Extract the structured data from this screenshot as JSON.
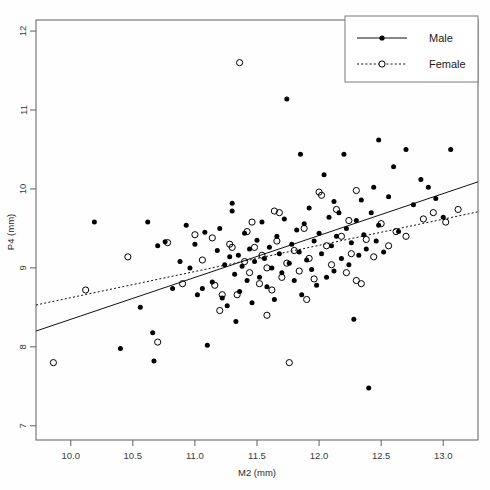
{
  "chart_data": {
    "type": "scatter",
    "title": "",
    "xlabel": "M2 (mm)",
    "ylabel": "P4 (mm)",
    "xlim": [
      9.72,
      13.28
    ],
    "ylim": [
      6.82,
      12.14
    ],
    "xticks": [
      "10.0",
      "10.5",
      "11.0",
      "11.5",
      "12.0",
      "12.5",
      "13.0"
    ],
    "xtick_values": [
      10.0,
      10.5,
      11.0,
      11.5,
      12.0,
      12.5,
      13.0
    ],
    "yticks": [
      "12",
      "11",
      "10",
      "9",
      "8",
      "7"
    ],
    "ytick_values": [
      12,
      11,
      10,
      9,
      8,
      7
    ],
    "grid": false,
    "legend_position": "top-right",
    "series": [
      {
        "name": "Male",
        "marker": "filled-circle",
        "line_style": "solid",
        "color": "#000000",
        "points": [
          [
            10.19,
            9.58
          ],
          [
            10.4,
            7.98
          ],
          [
            10.56,
            8.5
          ],
          [
            10.62,
            9.58
          ],
          [
            10.66,
            8.18
          ],
          [
            10.67,
            7.82
          ],
          [
            10.7,
            9.28
          ],
          [
            10.76,
            9.33
          ],
          [
            10.82,
            8.74
          ],
          [
            10.88,
            9.08
          ],
          [
            10.93,
            9.54
          ],
          [
            10.96,
            9.0
          ],
          [
            11.0,
            9.3
          ],
          [
            11.02,
            8.66
          ],
          [
            11.06,
            8.74
          ],
          [
            11.08,
            9.45
          ],
          [
            11.1,
            8.02
          ],
          [
            11.14,
            8.82
          ],
          [
            11.18,
            9.22
          ],
          [
            11.2,
            9.5
          ],
          [
            11.22,
            8.62
          ],
          [
            11.24,
            9.04
          ],
          [
            11.26,
            8.52
          ],
          [
            11.28,
            9.14
          ],
          [
            11.3,
            9.72
          ],
          [
            11.32,
            8.92
          ],
          [
            11.33,
            8.32
          ],
          [
            11.35,
            9.16
          ],
          [
            11.36,
            8.7
          ],
          [
            11.38,
            9.02
          ],
          [
            11.4,
            9.44
          ],
          [
            11.42,
            8.84
          ],
          [
            11.44,
            9.24
          ],
          [
            11.46,
            8.56
          ],
          [
            11.48,
            9.08
          ],
          [
            11.5,
            9.35
          ],
          [
            11.52,
            8.88
          ],
          [
            11.54,
            9.58
          ],
          [
            11.56,
            9.12
          ],
          [
            11.58,
            8.76
          ],
          [
            11.6,
            9.26
          ],
          [
            11.62,
            9.0
          ],
          [
            11.64,
            8.6
          ],
          [
            11.66,
            9.4
          ],
          [
            11.68,
            9.18
          ],
          [
            11.7,
            8.94
          ],
          [
            11.72,
            9.62
          ],
          [
            11.74,
            11.14
          ],
          [
            11.76,
            9.06
          ],
          [
            11.78,
            9.3
          ],
          [
            11.8,
            8.84
          ],
          [
            11.82,
            9.48
          ],
          [
            11.84,
            9.2
          ],
          [
            11.86,
            8.66
          ],
          [
            11.88,
            9.56
          ],
          [
            11.9,
            9.1
          ],
          [
            11.92,
            9.76
          ],
          [
            11.94,
            8.98
          ],
          [
            11.96,
            9.34
          ],
          [
            11.98,
            8.78
          ],
          [
            12.0,
            9.44
          ],
          [
            12.02,
            9.18
          ],
          [
            12.04,
            10.18
          ],
          [
            12.06,
            8.88
          ],
          [
            12.08,
            9.64
          ],
          [
            12.1,
            9.28
          ],
          [
            12.12,
            8.96
          ],
          [
            12.14,
            9.4
          ],
          [
            12.16,
            9.7
          ],
          [
            12.18,
            9.12
          ],
          [
            12.2,
            10.44
          ],
          [
            12.22,
            9.5
          ],
          [
            12.24,
            9.04
          ],
          [
            12.26,
            9.32
          ],
          [
            12.28,
            8.35
          ],
          [
            12.3,
            9.6
          ],
          [
            12.32,
            9.16
          ],
          [
            12.34,
            9.86
          ],
          [
            12.36,
            9.42
          ],
          [
            12.38,
            9.24
          ],
          [
            12.4,
            7.48
          ],
          [
            12.42,
            9.7
          ],
          [
            12.44,
            10.02
          ],
          [
            12.46,
            9.34
          ],
          [
            12.48,
            9.54
          ],
          [
            12.52,
            9.2
          ],
          [
            12.56,
            9.9
          ],
          [
            12.6,
            10.28
          ],
          [
            12.64,
            9.46
          ],
          [
            12.7,
            10.5
          ],
          [
            12.76,
            9.8
          ],
          [
            12.82,
            10.12
          ],
          [
            12.88,
            10.02
          ],
          [
            12.94,
            9.88
          ],
          [
            13.0,
            9.64
          ],
          [
            13.06,
            10.5
          ],
          [
            11.85,
            10.44
          ],
          [
            12.48,
            10.62
          ],
          [
            11.3,
            9.82
          ],
          [
            12.12,
            9.84
          ]
        ]
      },
      {
        "name": "Female",
        "marker": "open-circle",
        "line_style": "dotted",
        "color": "#000000",
        "points": [
          [
            9.86,
            7.8
          ],
          [
            10.12,
            8.72
          ],
          [
            10.46,
            9.14
          ],
          [
            10.7,
            8.06
          ],
          [
            10.78,
            9.32
          ],
          [
            10.9,
            8.8
          ],
          [
            11.0,
            9.42
          ],
          [
            11.06,
            9.1
          ],
          [
            11.14,
            9.38
          ],
          [
            11.16,
            8.78
          ],
          [
            11.22,
            8.66
          ],
          [
            11.28,
            9.3
          ],
          [
            11.3,
            9.26
          ],
          [
            11.34,
            8.66
          ],
          [
            11.36,
            11.6
          ],
          [
            11.4,
            9.08
          ],
          [
            11.42,
            9.46
          ],
          [
            11.44,
            8.94
          ],
          [
            11.48,
            9.26
          ],
          [
            11.52,
            8.8
          ],
          [
            11.54,
            9.16
          ],
          [
            11.58,
            9.0
          ],
          [
            11.62,
            8.72
          ],
          [
            11.66,
            9.34
          ],
          [
            11.7,
            8.88
          ],
          [
            11.74,
            9.06
          ],
          [
            11.76,
            7.8
          ],
          [
            11.8,
            9.22
          ],
          [
            11.84,
            8.96
          ],
          [
            11.88,
            9.5
          ],
          [
            11.92,
            9.12
          ],
          [
            11.96,
            8.86
          ],
          [
            12.0,
            9.96
          ],
          [
            12.02,
            9.92
          ],
          [
            12.06,
            9.28
          ],
          [
            12.1,
            9.04
          ],
          [
            12.14,
            9.74
          ],
          [
            12.18,
            9.4
          ],
          [
            12.22,
            8.94
          ],
          [
            12.26,
            9.18
          ],
          [
            12.3,
            9.98
          ],
          [
            12.34,
            8.8
          ],
          [
            12.38,
            9.36
          ],
          [
            12.44,
            9.14
          ],
          [
            12.5,
            9.56
          ],
          [
            12.56,
            9.28
          ],
          [
            12.62,
            9.46
          ],
          [
            12.7,
            9.4
          ],
          [
            12.84,
            9.62
          ],
          [
            12.92,
            9.7
          ],
          [
            13.02,
            9.58
          ],
          [
            13.12,
            9.74
          ],
          [
            11.64,
            9.72
          ],
          [
            11.68,
            9.7
          ],
          [
            11.46,
            9.58
          ],
          [
            12.24,
            9.6
          ],
          [
            11.58,
            8.4
          ],
          [
            11.2,
            8.46
          ],
          [
            12.3,
            8.84
          ],
          [
            11.9,
            8.6
          ]
        ]
      }
    ],
    "trendlines": [
      {
        "name": "Male",
        "style": "solid",
        "x_start": 9.72,
        "y_start": 8.2,
        "x_end": 13.28,
        "y_end": 10.09
      },
      {
        "name": "Female",
        "style": "dotted",
        "x_start": 9.72,
        "y_start": 8.53,
        "x_end": 13.28,
        "y_end": 9.71
      }
    ]
  },
  "legend": {
    "entries": [
      {
        "label": "Male",
        "marker": "filled-circle",
        "line_style": "solid"
      },
      {
        "label": "Female",
        "marker": "open-circle",
        "line_style": "dotted"
      }
    ]
  },
  "colors": {
    "marker": "#000000",
    "frame": "#5f5f5f",
    "text": "#1a1a1a",
    "background": "#fefefe"
  }
}
